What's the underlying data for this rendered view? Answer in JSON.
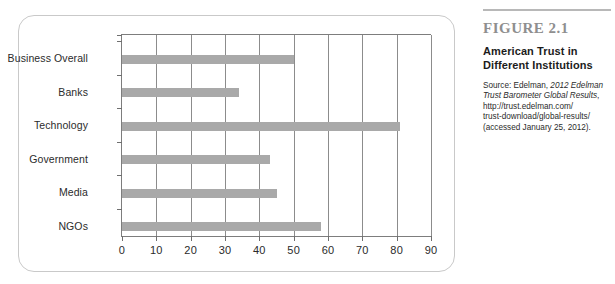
{
  "figure_card": {
    "border_color": "#c9c9c9"
  },
  "caption": {
    "figure_number": "FIGURE 2.1",
    "title_line1": "American Trust in",
    "title_line2": "Different Institutions",
    "source_prefix": "Source: Edelman, ",
    "source_italic1": "2012 Edelman",
    "source_italic2": "Trust Barometer Global Results",
    "source_comma": ",",
    "source_url_line1": "http://trust.edelman.com/",
    "source_url_line2": "trust-download/global-results/",
    "source_accessed": "(accessed January 25, 2012)."
  },
  "chart_data": {
    "type": "bar",
    "orientation": "horizontal",
    "title": "American Trust in Different Institutions",
    "xlabel": "",
    "ylabel": "",
    "categories": [
      "Business Overall",
      "Banks",
      "Technology",
      "Government",
      "Media",
      "NGOs"
    ],
    "values": [
      50,
      34,
      81,
      43,
      45,
      58
    ],
    "xlim": [
      0,
      90
    ],
    "xticks": [
      0,
      10,
      20,
      30,
      40,
      50,
      60,
      70,
      80,
      90
    ],
    "xtick_labels": [
      "0",
      "10",
      "20",
      "30",
      "40",
      "50",
      "60",
      "70",
      "80",
      "90"
    ],
    "grid": true,
    "grid_axis": "x",
    "legend": false,
    "bar_color": "#a9a9a9",
    "axis_color": "#7d7d7d"
  }
}
